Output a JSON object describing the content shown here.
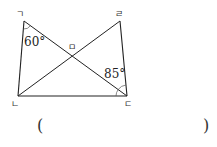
{
  "figure": {
    "points": {
      "top_left": {
        "label": "ㄱ",
        "x": 24,
        "y": 21
      },
      "top_right": {
        "label": "ㄹ",
        "x": 120,
        "y": 21
      },
      "bottom_left": {
        "label": "ㄴ",
        "x": 18,
        "y": 96
      },
      "bottom_right": {
        "label": "ㄷ",
        "x": 127,
        "y": 96
      },
      "intersection": {
        "label": "ㅁ"
      }
    },
    "angles": {
      "angle_at_top_left": "60°",
      "angle_at_bottom_right": "85°"
    }
  },
  "answer": {
    "open_paren": "(",
    "close_paren": ")",
    "value": ""
  }
}
